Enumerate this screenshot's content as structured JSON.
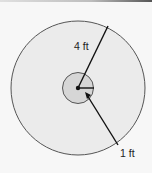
{
  "diagram": {
    "type": "concentric-circles",
    "outer_circle": {
      "radius_label": "4 ft",
      "fill": "#ebebeb",
      "stroke": "#555555"
    },
    "inner_circle": {
      "radius_label": "1 ft",
      "fill": "#d6d6d6",
      "stroke": "#555555"
    },
    "labels": {
      "outer_radius": "4 ft",
      "inner_radius": "1 ft"
    }
  }
}
